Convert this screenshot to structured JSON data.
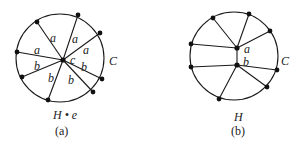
{
  "figure": {
    "panels": [
      {
        "id": "a",
        "caption": "(a)",
        "graph_label": "H • e",
        "cycle_label": "C",
        "hub_label": "c",
        "edge_labels": [
          "a",
          "a",
          "a",
          "a",
          "b",
          "b",
          "b",
          "b"
        ]
      },
      {
        "id": "b",
        "caption": "(b)",
        "graph_label": "H",
        "cycle_label": "C",
        "node_labels": [
          "a",
          "b"
        ]
      }
    ]
  },
  "colors": {
    "stroke": "#1a1a1a",
    "node": "#111111",
    "text": "#222222",
    "background": "#ffffff"
  }
}
